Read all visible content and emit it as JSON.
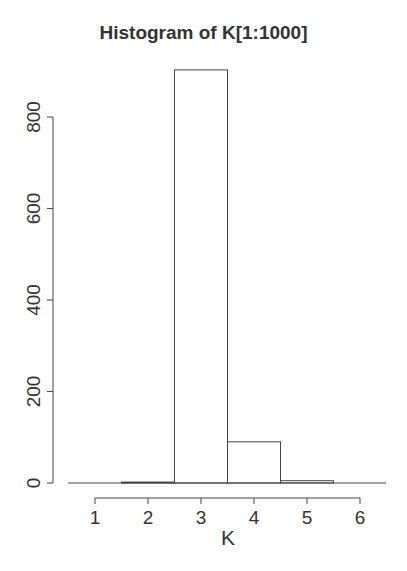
{
  "chart_data": {
    "type": "bar",
    "title": "Histogram of K[1:1000]",
    "xlabel": "K",
    "ylabel": "",
    "bin_edges": [
      0.5,
      1.5,
      2.5,
      3.5,
      4.5,
      5.5,
      6.5
    ],
    "categories": [
      "1",
      "2",
      "3",
      "4",
      "5",
      "6"
    ],
    "values": [
      0,
      2,
      903,
      90,
      5,
      0
    ],
    "x_ticks": [
      "1",
      "2",
      "3",
      "4",
      "5",
      "6"
    ],
    "y_ticks": [
      "0",
      "200",
      "400",
      "600",
      "800"
    ],
    "xlim": [
      0.5,
      6.5
    ],
    "ylim": [
      0,
      905
    ],
    "grid": false,
    "legend": null
  }
}
